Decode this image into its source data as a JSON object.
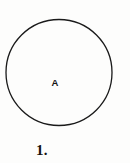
{
  "figure": {
    "caption": "1.",
    "background_color": "#fdfdfc",
    "stroke_color": "#1a1a1a",
    "label_color": "#141414"
  },
  "diagram": {
    "type": "circle",
    "interior_label": "A",
    "shape_name": "circle-outline",
    "center_x": 59,
    "center_y": 72,
    "radius": 53,
    "stroke_width": 1.3,
    "fill": "none"
  }
}
